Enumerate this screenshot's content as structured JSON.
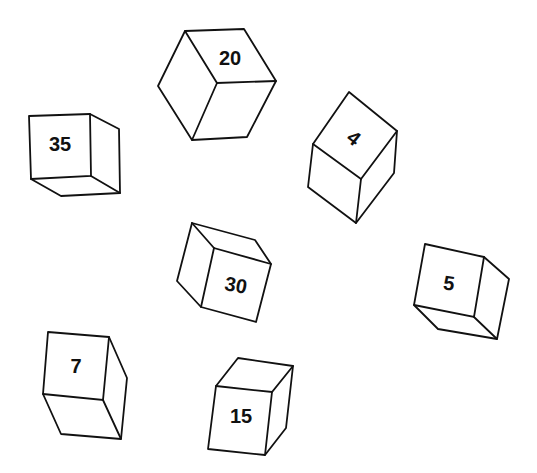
{
  "diagram": {
    "title": "",
    "background": "#ffffff",
    "stroke_color": "#111111",
    "cubes": [
      {
        "label": "20",
        "position": "top-center"
      },
      {
        "label": "35",
        "position": "upper-left"
      },
      {
        "label": "4",
        "position": "upper-right"
      },
      {
        "label": "30",
        "position": "center"
      },
      {
        "label": "5",
        "position": "right"
      },
      {
        "label": "7",
        "position": "lower-left"
      },
      {
        "label": "15",
        "position": "bottom-center"
      }
    ]
  }
}
